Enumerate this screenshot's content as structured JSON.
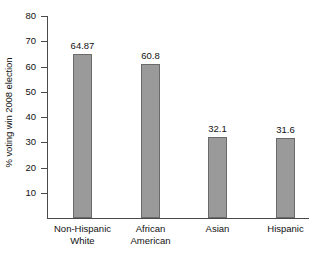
{
  "chart_data": {
    "type": "bar",
    "title": "",
    "subtitle": "",
    "xlabel": "",
    "ylabel": "% voting win 2008 election",
    "categories": [
      "Non-Hispanic White",
      "African American",
      "Asian",
      "Hispanic"
    ],
    "category_lines": [
      [
        "Non-Hispanic",
        "White"
      ],
      [
        "African",
        "American"
      ],
      [
        "Asian",
        ""
      ],
      [
        "Hispanic",
        ""
      ]
    ],
    "values": [
      64.87,
      60.8,
      32.1,
      31.6
    ],
    "value_labels": [
      "64.87",
      "60.8",
      "32.1",
      "31.6"
    ],
    "ylim": [
      0,
      80
    ],
    "yticks": [
      10,
      20,
      30,
      40,
      50,
      60,
      70,
      80
    ],
    "ytick_labels": [
      "10",
      "20",
      "30",
      "40",
      "50",
      "60",
      "70",
      "80"
    ],
    "grid": false,
    "legend": "none",
    "bar_color": "#9a9a9a",
    "bar_edge_color": "#6b6b6b",
    "axis_color": "#4a4a4a",
    "background_color": "#ffffff"
  }
}
